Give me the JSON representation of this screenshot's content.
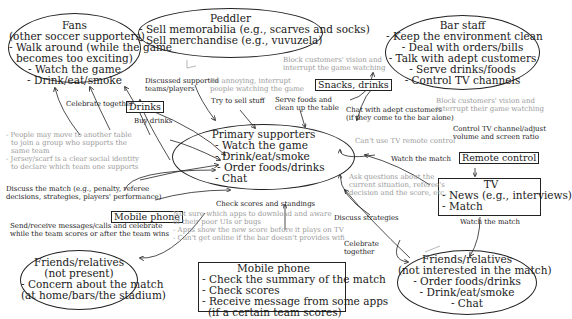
{
  "nodes": {
    "fans": {
      "title": "Fans",
      "subtitle": "(other soccer supporters)",
      "items": [
        "- Walk around (while the game",
        "becomes too exciting)",
        "- Watch the game",
        "- Drink/eat/smoke"
      ]
    },
    "peddler": {
      "title": "Peddler",
      "items": [
        "- Sell memorabilia (e.g., scarves and socks)",
        "- Sell merchandise (e.g., vuvuzela)"
      ]
    },
    "bar_staff": {
      "title": "Bar staff",
      "items": [
        "- Keep the environment clean",
        "- Deal with orders/bills",
        "- Talk with adept customers",
        "- Serve drinks/foods",
        "- Control TV channels"
      ]
    },
    "primary": {
      "title": "Primary supporters",
      "items": [
        "- Watch the game",
        "- Drink/eat/smoke",
        "- Order foods/drinks",
        "- Chat"
      ]
    },
    "tv": {
      "title": "TV",
      "items": [
        "- News (e.g., interviews)",
        "- Match"
      ]
    },
    "friends_absent": {
      "title": "Friends/relatives",
      "subtitle": "(not present)",
      "items": [
        "- Concern about the match",
        "(at home/bars/the stadium)"
      ]
    },
    "mobile": {
      "title": "Mobile phone",
      "items": [
        "- Check the summary of the match",
        "- Check scores",
        "- Receive message from some apps",
        "(if a certain team scores)"
      ]
    },
    "friends_present": {
      "title": "Friends/relatives",
      "subtitle": "(not interested in the match)",
      "items": [
        "- Order foods/drinks",
        "- Drink/eat/smoke",
        "- Chat"
      ]
    }
  },
  "artifacts": {
    "drinks": "Drinks",
    "snacks": "Snacks, drinks",
    "remote": "Remote control",
    "mobile_phone": "Mobile phone"
  },
  "edge_labels": {
    "celebrate_together": "Celebrate together",
    "buy_drinks": "Buy drinks",
    "discussed_teams": [
      "Discussed supported",
      "teams/players"
    ],
    "annoying": [
      "Be annoying, interrupt",
      "people watching the game"
    ],
    "try_to_sell": "Try to sell stuff",
    "block_vision_top": [
      "Block customers' vision and",
      "interrupt the game watching"
    ],
    "serve_foods": [
      "Serve foods and",
      "clean up the table"
    ],
    "chat_adept": [
      "Chat with adept customers",
      "(if they come to the bar alone)"
    ],
    "block_vision_right": [
      "Block customers' vision and",
      "interrupt their game watching"
    ],
    "control_tv": [
      "Control TV channel/adjust",
      "volume and screen ratio"
    ],
    "cant_use_remote": "Can't use TV remote control",
    "watch_match_1": "Watch the match",
    "ask_questions": [
      "Ask questions about the",
      "current situation, referee's",
      "decision and the score, etc."
    ],
    "move_table": [
      "- People may move to another table",
      "to join a group who supports the",
      "same team",
      "- Jersey/scarf is a clear social identity",
      "to declare which team one supports"
    ],
    "discuss_match": [
      "Discuss the match (e.g., penalty, referee",
      "decisions, strategies, players' performance)"
    ],
    "send_receive": [
      "Send/receive messages/calls and celebrate",
      "while the team scores or after the team wins"
    ],
    "check_scores": "Check scores and standings",
    "mobile_problems": [
      "Not sure which apps to download and aware",
      "of their poor UIs or bugs",
      "- Apps show the new score before it plays on TV",
      "- Can't get online if the bar doesn't provides wifi"
    ],
    "discuss_strategies": "Discuss strategies",
    "celebrate_together_2": [
      "Celebrate",
      "together"
    ],
    "watch_match_2": "Watch the match"
  },
  "colors": {
    "line": "#222222",
    "problem_text": "#9a9a9a",
    "background": "#ffffff"
  }
}
